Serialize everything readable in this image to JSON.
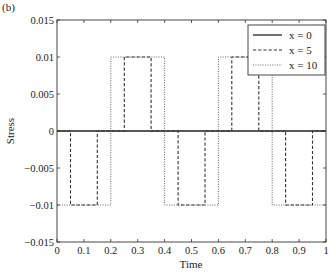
{
  "panel_label": "(b)",
  "chart_data": {
    "type": "line",
    "title": "",
    "xlabel": "Time",
    "ylabel": "Stress",
    "xlim": [
      0,
      1
    ],
    "ylim": [
      -0.015,
      0.015
    ],
    "xticks": [
      0,
      0.1,
      0.2,
      0.3,
      0.4,
      0.5,
      0.6,
      0.7,
      0.8,
      0.9,
      1
    ],
    "xtick_labels": [
      "0",
      "0.1",
      "0.2",
      "0.3",
      "0.4",
      "0.5",
      "0.6",
      "0.7",
      "0.8",
      "0.9",
      "1"
    ],
    "yticks": [
      -0.015,
      -0.01,
      -0.005,
      0,
      0.005,
      0.01,
      0.015
    ],
    "ytick_labels": [
      "−0.015",
      "−0.01",
      "−0.005",
      "0",
      "0.005",
      "0.01",
      "0.015"
    ],
    "grid": false,
    "legend_position": "upper right",
    "series": [
      {
        "name": "x = 0",
        "style": "solid",
        "x": [
          0,
          1
        ],
        "y": [
          0,
          0
        ]
      },
      {
        "name": "x = 5",
        "style": "dashed",
        "x": [
          0,
          0.05,
          0.05,
          0.15,
          0.15,
          0.25,
          0.25,
          0.35,
          0.35,
          0.45,
          0.45,
          0.55,
          0.55,
          0.65,
          0.65,
          0.75,
          0.75,
          0.85,
          0.85,
          0.95,
          0.95,
          1
        ],
        "y": [
          0,
          0,
          -0.01,
          -0.01,
          0,
          0,
          0.01,
          0.01,
          0,
          0,
          -0.01,
          -0.01,
          0,
          0,
          0.01,
          0.01,
          0,
          0,
          -0.01,
          -0.01,
          0,
          0
        ]
      },
      {
        "name": "x = 10",
        "style": "dotted",
        "x": [
          0,
          0.2,
          0.2,
          0.4,
          0.4,
          0.6,
          0.6,
          0.8,
          0.8,
          1
        ],
        "y": [
          -0.01,
          -0.01,
          0.01,
          0.01,
          -0.01,
          -0.01,
          0.01,
          0.01,
          -0.01,
          -0.01
        ]
      }
    ]
  }
}
